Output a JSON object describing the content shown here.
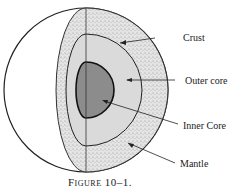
{
  "figure": {
    "caption": "Figure 10–1.",
    "labels": {
      "crust": "Crust",
      "outer_core": "Outer core",
      "inner_core": "Inner Core",
      "mantle": "Mantle"
    }
  }
}
